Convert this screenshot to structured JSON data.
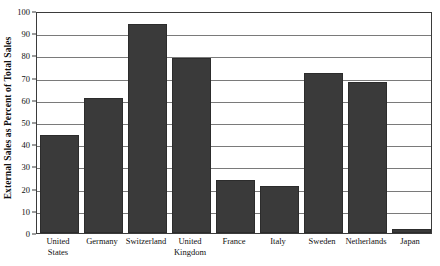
{
  "chart_data": {
    "type": "bar",
    "title": "",
    "xlabel": "",
    "ylabel": "External Sales as Percent of Total Sales",
    "ylim": [
      0,
      100
    ],
    "ytick_step": 10,
    "yticks": [
      0,
      10,
      20,
      30,
      40,
      50,
      60,
      70,
      80,
      90,
      100
    ],
    "grid": true,
    "legend": "none",
    "bar_color": "#3a3a3a",
    "axis_color": "#3b3b3b",
    "gridline_color": "#7a7a7a",
    "categories": [
      "United States",
      "Germany",
      "Switzerland",
      "United Kingdom",
      "France",
      "Italy",
      "Sweden",
      "Netherlands",
      "Japan"
    ],
    "category_lines": [
      [
        "United",
        "States"
      ],
      [
        "Germany",
        ""
      ],
      [
        "Switzerland",
        ""
      ],
      [
        "United",
        "Kingdom"
      ],
      [
        "France",
        ""
      ],
      [
        "Italy",
        ""
      ],
      [
        "Sweden",
        ""
      ],
      [
        "Netherlands",
        ""
      ],
      [
        "Japan",
        ""
      ]
    ],
    "values": [
      44,
      61,
      94,
      79,
      24,
      21,
      72,
      68,
      2
    ]
  }
}
